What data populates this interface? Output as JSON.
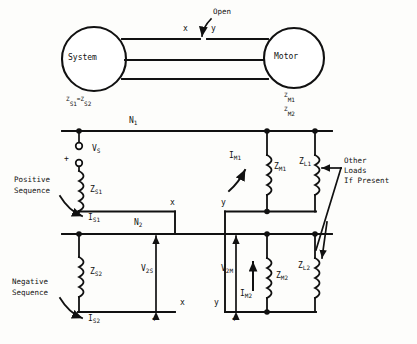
{
  "figure": {
    "stroke_color": "#111111",
    "background_color": "#fdfdfb"
  },
  "one_line": {
    "system_node": "System",
    "motor_node": "Motor",
    "open_label": "Open",
    "terminal_x": "x",
    "terminal_y": "y",
    "system_impedance": {
      "base": "Z",
      "sub1": "S1",
      "eq": "=",
      "base2": "Z",
      "sub2": "S2"
    },
    "motor_impedance_1": {
      "base": "Z",
      "sub": "M1"
    },
    "motor_impedance_2": {
      "base": "Z",
      "sub": "M2"
    }
  },
  "positive_sequence": {
    "bus_label": {
      "base": "N",
      "sub": "1"
    },
    "source_label": {
      "base": "V",
      "sub": "S"
    },
    "source_polarity": "+",
    "section_label_line1": "Positive",
    "section_label_line2": "Sequence",
    "source_impedance": {
      "base": "Z",
      "sub": "S1"
    },
    "source_current": {
      "base": "I",
      "sub": "S1"
    },
    "motor_current": {
      "base": "I",
      "sub": "M1"
    },
    "motor_impedance": {
      "base": "Z",
      "sub": "M1"
    },
    "load_impedance": {
      "base": "Z",
      "sub": "L1"
    },
    "terminal_x": "x",
    "terminal_y": "y"
  },
  "negative_sequence": {
    "bus_label": {
      "base": "N",
      "sub": "2"
    },
    "section_label_line1": "Negative",
    "section_label_line2": "Sequence",
    "source_impedance": {
      "base": "Z",
      "sub": "S2"
    },
    "source_current": {
      "base": "I",
      "sub": "S2"
    },
    "source_voltage": {
      "base": "V",
      "sub": "2S"
    },
    "motor_voltage": {
      "base": "V",
      "sub": "2M"
    },
    "motor_current": {
      "base": "I",
      "sub": "M2"
    },
    "motor_impedance": {
      "base": "Z",
      "sub": "M2"
    },
    "load_impedance": {
      "base": "Z",
      "sub": "L2"
    },
    "terminal_x": "x",
    "terminal_y": "y",
    "polarity_left": "+",
    "polarity_right": "+"
  },
  "annotations": {
    "other_loads_line1": "Other",
    "other_loads_line2": "Loads",
    "other_loads_line3": "If Present"
  }
}
